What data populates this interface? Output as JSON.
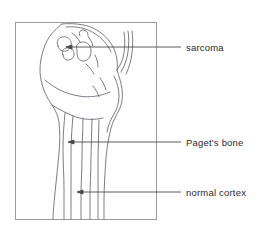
{
  "figure": {
    "type": "anatomical-line-drawing",
    "background_color": "#ffffff",
    "line_color": "#6e6e78",
    "frame_color": "#9a9a9a",
    "text_color": "#2b2b2b",
    "frame": {
      "x": 15,
      "y": 22,
      "width": 142,
      "height": 198
    },
    "annotations": [
      {
        "id": "sarcoma",
        "label": "sarcoma",
        "icon": "leader-line-arrow-icon",
        "arrow_tip": {
          "x": 67,
          "y": 47
        },
        "line_start": {
          "x": 181,
          "y": 47
        },
        "text_position": {
          "x": 186,
          "y": 47
        }
      },
      {
        "id": "pagets-bone",
        "label": "Paget's bone",
        "icon": "leader-line-arrow-icon",
        "arrow_tip": {
          "x": 69,
          "y": 142
        },
        "line_start": {
          "x": 181,
          "y": 142
        },
        "text_position": {
          "x": 186,
          "y": 142
        }
      },
      {
        "id": "normal-cortex",
        "label": "normal cortex",
        "icon": "leader-line-arrow-icon",
        "arrow_tip": {
          "x": 78,
          "y": 192
        },
        "line_start": {
          "x": 181,
          "y": 192
        },
        "text_position": {
          "x": 186,
          "y": 192
        }
      }
    ]
  }
}
